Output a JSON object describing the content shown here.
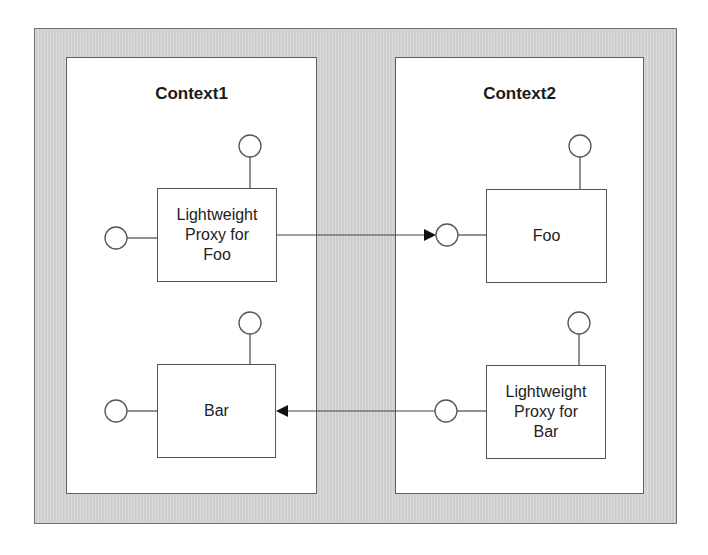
{
  "diagram": {
    "contexts": [
      {
        "title": "Context1",
        "components": [
          {
            "id": "proxy-foo",
            "lines": [
              "Lightweight",
              "Proxy for",
              "Foo"
            ]
          },
          {
            "id": "bar",
            "lines": [
              "Bar"
            ]
          }
        ]
      },
      {
        "title": "Context2",
        "components": [
          {
            "id": "foo",
            "lines": [
              "Foo"
            ]
          },
          {
            "id": "proxy-bar",
            "lines": [
              "Lightweight",
              "Proxy for",
              "Bar"
            ]
          }
        ]
      }
    ],
    "connections": [
      {
        "from": "Lightweight Proxy for Foo",
        "to": "Foo",
        "direction": "right"
      },
      {
        "from": "Lightweight Proxy for Bar",
        "to": "Bar",
        "direction": "left"
      }
    ],
    "colors": {
      "frame_fill": "#d2d2d2",
      "frame_border": "#6f6f6f",
      "context_fill": "#ffffff",
      "line": "#555555"
    }
  }
}
